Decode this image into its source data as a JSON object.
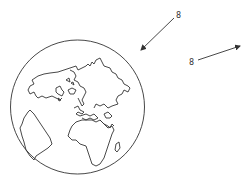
{
  "figure": {
    "stroke_color": "#333333",
    "background": "#ffffff"
  },
  "globe": {
    "center_x": 77.5,
    "center_y": 107,
    "radius": 67
  },
  "arrows": [
    {
      "label": "8",
      "direction": "incoming toward globe",
      "from": [
        174,
        18
      ],
      "to": [
        141,
        50
      ],
      "label_pos": [
        176,
        18
      ]
    },
    {
      "label": "8",
      "direction": "outgoing away from globe",
      "from": [
        198,
        60
      ],
      "to": [
        240,
        46
      ],
      "label_pos": [
        189,
        65
      ]
    }
  ]
}
